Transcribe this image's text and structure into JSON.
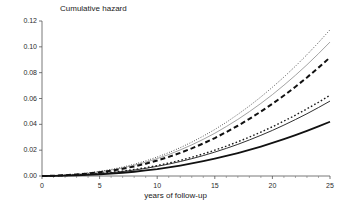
{
  "chart_data": {
    "type": "line",
    "title": "Cumulative hazard",
    "subtitle": "",
    "xlabel": "years of follow-up",
    "ylabel": "",
    "xlim": [
      0,
      25
    ],
    "ylim": [
      0.0,
      0.12
    ],
    "grid": false,
    "legend": "none",
    "xticks": [
      0,
      5,
      10,
      15,
      20,
      25
    ],
    "xtick_labels": [
      "0",
      "5",
      "10",
      "15",
      "20",
      "25"
    ],
    "x_minor_ticks": [
      1,
      2,
      3,
      4,
      6,
      7,
      8,
      9,
      11,
      12,
      13,
      14,
      16,
      17,
      18,
      19,
      21,
      22,
      23,
      24
    ],
    "yticks": [
      0.0,
      0.02,
      0.04,
      0.06,
      0.08,
      0.1,
      0.12
    ],
    "ytick_labels": [
      "0.00",
      "0.02",
      "0.04",
      "0.06",
      "0.08",
      "0.10",
      "0.12"
    ],
    "x": [
      0,
      1,
      2,
      3,
      4,
      5,
      6,
      7,
      8,
      9,
      10,
      11,
      12,
      13,
      14,
      15,
      16,
      17,
      18,
      19,
      20,
      21,
      22,
      23,
      24,
      25
    ],
    "series": [
      {
        "name": "curve-1",
        "style": "fine-dotted",
        "color": "#1a1a1a",
        "width": 1.0,
        "dash": "0.7,1.8",
        "values": [
          0.0,
          0.0003,
          0.0008,
          0.0015,
          0.0024,
          0.0036,
          0.0051,
          0.0069,
          0.0091,
          0.0117,
          0.0147,
          0.0181,
          0.0219,
          0.0262,
          0.0309,
          0.036,
          0.0416,
          0.0477,
          0.0542,
          0.0612,
          0.0687,
          0.0766,
          0.085,
          0.0939,
          0.1033,
          0.1132
        ]
      },
      {
        "name": "curve-2",
        "style": "thin-gray-solid",
        "color": "#8a8a8a",
        "width": 0.8,
        "dash": "",
        "values": [
          0.0,
          0.0003,
          0.0007,
          0.0013,
          0.0021,
          0.0032,
          0.0046,
          0.0063,
          0.0083,
          0.0107,
          0.0135,
          0.0166,
          0.0202,
          0.0241,
          0.0284,
          0.0331,
          0.0383,
          0.0438,
          0.0498,
          0.0562,
          0.063,
          0.0703,
          0.078,
          0.0861,
          0.0947,
          0.1037
        ]
      },
      {
        "name": "curve-3",
        "style": "thick-dashed",
        "color": "#111111",
        "width": 2.0,
        "dash": "5,3",
        "values": [
          0.0,
          0.0002,
          0.0006,
          0.0012,
          0.0019,
          0.0029,
          0.0041,
          0.0056,
          0.0074,
          0.0095,
          0.012,
          0.0148,
          0.0179,
          0.0214,
          0.0252,
          0.0294,
          0.034,
          0.0389,
          0.0442,
          0.0499,
          0.0559,
          0.0623,
          0.0691,
          0.0763,
          0.0839,
          0.0918
        ]
      },
      {
        "name": "curve-4",
        "style": "medium-dotted",
        "color": "#1a1a1a",
        "width": 1.4,
        "dash": "1.6,2.2",
        "values": [
          0.0,
          0.0002,
          0.0004,
          0.0008,
          0.0013,
          0.002,
          0.0028,
          0.0038,
          0.005,
          0.0064,
          0.0081,
          0.01,
          0.0121,
          0.0145,
          0.0171,
          0.02,
          0.0231,
          0.0265,
          0.0301,
          0.034,
          0.0381,
          0.0425,
          0.0471,
          0.052,
          0.0571,
          0.0625
        ]
      },
      {
        "name": "curve-5",
        "style": "thin-solid",
        "color": "#1a1a1a",
        "width": 0.9,
        "dash": "",
        "values": [
          0.0,
          0.0002,
          0.0004,
          0.0007,
          0.0012,
          0.0018,
          0.0026,
          0.0035,
          0.0046,
          0.0059,
          0.0075,
          0.0092,
          0.0112,
          0.0134,
          0.0158,
          0.0185,
          0.0214,
          0.0245,
          0.0279,
          0.0315,
          0.0353,
          0.0394,
          0.0437,
          0.0482,
          0.053,
          0.058
        ]
      },
      {
        "name": "curve-6",
        "style": "thick-solid",
        "color": "#111111",
        "width": 1.8,
        "dash": "",
        "values": [
          0.0,
          0.0001,
          0.0003,
          0.0005,
          0.0008,
          0.0013,
          0.0018,
          0.0025,
          0.0033,
          0.0043,
          0.0054,
          0.0067,
          0.0081,
          0.0097,
          0.0115,
          0.0134,
          0.0155,
          0.0178,
          0.0202,
          0.0228,
          0.0256,
          0.0285,
          0.0316,
          0.0349,
          0.0384,
          0.042
        ]
      }
    ]
  },
  "axes": {
    "x_axis_name": "years of follow-up",
    "y_axis_name": "Cumulative hazard"
  }
}
